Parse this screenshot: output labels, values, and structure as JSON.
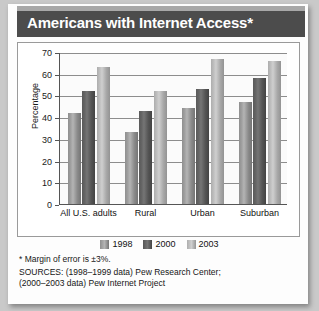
{
  "title": "Americans with Internet Access*",
  "chart_data": {
    "type": "bar",
    "title": "Americans with Internet Access*",
    "xlabel": "",
    "ylabel": "Percentage",
    "ylim": [
      0,
      70
    ],
    "yticks": [
      0,
      10,
      20,
      30,
      40,
      50,
      60,
      70
    ],
    "grid": true,
    "legend_position": "bottom",
    "categories": [
      "All U.S. adults",
      "Rural",
      "Urban",
      "Suburban"
    ],
    "series": [
      {
        "name": "1998",
        "color": "#9a9a9a",
        "values": [
          42,
          33,
          44,
          47
        ]
      },
      {
        "name": "2000",
        "color": "#5b5b5b",
        "values": [
          52,
          43,
          53,
          58
        ]
      },
      {
        "name": "2003",
        "color": "#c2c2c2",
        "values": [
          63,
          52,
          67,
          66
        ]
      }
    ]
  },
  "footnotes": {
    "margin_of_error": "* Margin of error is ±3%.",
    "sources_line_1": "SOURCES: (1998–1999 data) Pew Research Center;",
    "sources_line_2": "(2000–2003 data) Pew Internet Project"
  }
}
